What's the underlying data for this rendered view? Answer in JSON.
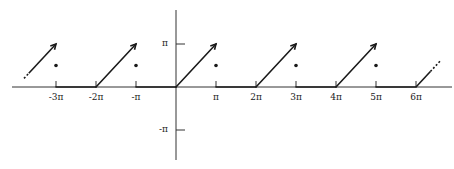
{
  "chart_data": {
    "type": "line",
    "title": "",
    "xlabel": "",
    "ylabel": "",
    "x_tick_labels": [
      "-3π",
      "-2π",
      "-π",
      "π",
      "2π",
      "3π",
      "4π",
      "5π",
      "6π"
    ],
    "x_tick_values_pi": [
      -3,
      -2,
      -1,
      1,
      2,
      3,
      4,
      5,
      6
    ],
    "y_tick_labels": [
      "π",
      "-π"
    ],
    "y_tick_values_pi": [
      1,
      -1
    ],
    "xlim_pi": [
      -4.3,
      6.9
    ],
    "ylim_pi": [
      -1.7,
      2.0
    ],
    "grid": false,
    "series": [
      {
        "name": "f(x)",
        "segments_pi": [
          {
            "x": [
              -3.8,
              -3.0
            ],
            "y": [
              0.2,
              1.0
            ],
            "style": "dashed-start",
            "end_marker": "open-arrow"
          },
          {
            "x": [
              -3.0,
              -2.0
            ],
            "y": [
              0,
              0
            ]
          },
          {
            "x": [
              -2.0,
              -1.0
            ],
            "y": [
              0,
              1.0
            ],
            "end_marker": "open-arrow"
          },
          {
            "x": [
              -1.0,
              0.0
            ],
            "y": [
              0,
              0
            ]
          },
          {
            "x": [
              0.0,
              1.0
            ],
            "y": [
              0,
              1.0
            ],
            "end_marker": "open-arrow"
          },
          {
            "x": [
              1.0,
              2.0
            ],
            "y": [
              0,
              0
            ]
          },
          {
            "x": [
              2.0,
              3.0
            ],
            "y": [
              0,
              1.0
            ],
            "end_marker": "open-arrow"
          },
          {
            "x": [
              3.0,
              4.0
            ],
            "y": [
              0,
              0
            ]
          },
          {
            "x": [
              4.0,
              5.0
            ],
            "y": [
              0,
              1.0
            ],
            "end_marker": "open-arrow"
          },
          {
            "x": [
              5.0,
              6.0
            ],
            "y": [
              0,
              0
            ]
          },
          {
            "x": [
              6.0,
              6.6
            ],
            "y": [
              0,
              0.6
            ],
            "style": "dashed-end"
          }
        ]
      },
      {
        "name": "midpoint values",
        "x_pi": [
          -3,
          -1,
          1,
          3,
          5
        ],
        "y_pi": [
          0.5,
          0.5,
          0.5,
          0.5,
          0.5
        ],
        "marker": "dot"
      }
    ]
  },
  "layout": {
    "origin_px": [
      176,
      87
    ],
    "pi_px_x": 40,
    "pi_px_y": 43,
    "line_color": "#1a1a1a",
    "axis_color": "#333333"
  }
}
